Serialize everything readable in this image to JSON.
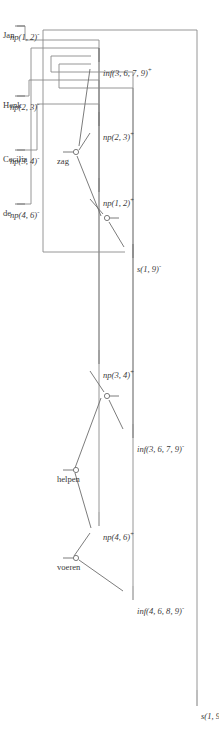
{
  "figure": {
    "kind": "proof-net",
    "orientation": "rotated-90",
    "stroke_color": "#6d6d6d",
    "wire_color": "#8a8a8a",
    "text_color": "#3a3a3a",
    "background": "#ffffff"
  },
  "nodes": [
    {
      "id": "s-root",
      "label": "s(1, 9)",
      "polarity": "+",
      "x": 700,
      "y": 22
    },
    {
      "id": "inf4689",
      "label": "inf(4, 6, 8, 9)",
      "polarity": "-",
      "x": 596,
      "y": 86
    },
    {
      "id": "np46",
      "label": "np(4, 6)",
      "polarity": "+",
      "x": 520,
      "y": 120
    },
    {
      "id": "inf3679n",
      "label": "inf(3, 6, 7, 9)",
      "polarity": "-",
      "x": 434,
      "y": 86
    },
    {
      "id": "np34",
      "label": "np(3, 4)",
      "polarity": "+",
      "x": 358,
      "y": 120
    },
    {
      "id": "s19n",
      "label": "s(1, 9)",
      "polarity": "-",
      "x": 252,
      "y": 86
    },
    {
      "id": "np12",
      "label": "np(1, 2)",
      "polarity": "+",
      "x": 186,
      "y": 120
    },
    {
      "id": "np23",
      "label": "np(2, 3)",
      "polarity": "+",
      "x": 120,
      "y": 120
    },
    {
      "id": "inf3679p",
      "label": "inf(3, 6, 7, 9)",
      "polarity": "+",
      "x": 56,
      "y": 120
    },
    {
      "id": "np12lex",
      "label": "np(1, 2)",
      "polarity": "-",
      "x": 26,
      "y": 196
    },
    {
      "id": "np23lex",
      "label": "np(2, 3)",
      "polarity": "-",
      "x": 96,
      "y": 196
    },
    {
      "id": "np34lex",
      "label": "np(3, 4)",
      "polarity": "-",
      "x": 150,
      "y": 196
    },
    {
      "id": "np46lex",
      "label": "np(4, 6)",
      "polarity": "-",
      "x": 204,
      "y": 196
    }
  ],
  "leaves": [
    {
      "id": "word-jan",
      "text": "Jan",
      "x": 26,
      "y": 212
    },
    {
      "id": "word-henk",
      "text": "Henk",
      "x": 96,
      "y": 212
    },
    {
      "id": "word-cecilia",
      "text": "Cecilia",
      "x": 150,
      "y": 212
    },
    {
      "id": "word-de",
      "text": "de",
      "x": 204,
      "y": 212
    },
    {
      "id": "word-zag",
      "text": "zag",
      "x": 192,
      "y": 150
    },
    {
      "id": "word-helpen",
      "text": "helpen",
      "x": 430,
      "y": 150
    },
    {
      "id": "word-voeren",
      "text": "voeren",
      "x": 600,
      "y": 150
    }
  ],
  "links": [
    {
      "id": "link-voeren",
      "hub_x": 558,
      "hub_y": 142,
      "left": "np46",
      "right": "inf4689"
    },
    {
      "id": "link-helpen",
      "hub_x": 470,
      "hub_y": 142,
      "left": "np34",
      "right": "inf3679n"
    },
    {
      "id": "link-inner",
      "hub_x": 396,
      "hub_y": 112,
      "left": "np34",
      "right": "inf3679n"
    },
    {
      "id": "link-zag",
      "hub_x": 152,
      "hub_y": 142,
      "left": "np23",
      "right": "inf3679p"
    },
    {
      "id": "link-upper",
      "hub_x": 218,
      "hub_y": 112,
      "left": "np12",
      "right": "s19n"
    }
  ],
  "axioms": [
    {
      "id": "axiom-s",
      "from": "s-root",
      "to": "s19n"
    },
    {
      "id": "axiom-inf1",
      "from": "inf4689",
      "to": "inf3679p"
    },
    {
      "id": "axiom-np46",
      "from": "np46",
      "to": "np46lex"
    },
    {
      "id": "axiom-inf2",
      "from": "inf3679n",
      "to": "inf3679p"
    },
    {
      "id": "axiom-np34",
      "from": "np34",
      "to": "np34lex"
    },
    {
      "id": "axiom-np12",
      "from": "np12",
      "to": "np12lex"
    },
    {
      "id": "axiom-np23",
      "from": "np23",
      "to": "np23lex"
    }
  ],
  "sentence": "Jan Henk Cecilia de zag helpen voeren"
}
